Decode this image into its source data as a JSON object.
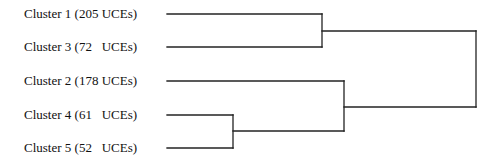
{
  "diagram": {
    "type": "dendrogram",
    "orientation": "horizontal",
    "leaves": [
      {
        "id": "c1",
        "label": "Cluster 1 (205 UCEs)",
        "cluster": 1,
        "ucEs": 205
      },
      {
        "id": "c3",
        "label": "Cluster 3 (72   UCEs)",
        "cluster": 3,
        "ucEs": 72
      },
      {
        "id": "c2",
        "label": "Cluster 2 (178 UCEs)",
        "cluster": 2,
        "ucEs": 178
      },
      {
        "id": "c4",
        "label": "Cluster 4 (61   UCEs)",
        "cluster": 4,
        "ucEs": 61
      },
      {
        "id": "c5",
        "label": "Cluster 5 (52   UCEs)",
        "cluster": 5,
        "ucEs": 52
      }
    ],
    "merges": [
      {
        "children": [
          "Cluster 4",
          "Cluster 5"
        ],
        "order": 1
      },
      {
        "children": [
          "Cluster 1",
          "Cluster 3"
        ],
        "order": 2
      },
      {
        "children": [
          "Cluster 2",
          "Cluster 4+5"
        ],
        "order": 3
      },
      {
        "children": [
          "Cluster 1+3",
          "Cluster 2+4+5"
        ],
        "order": 4
      }
    ],
    "line_color": "#222222"
  }
}
